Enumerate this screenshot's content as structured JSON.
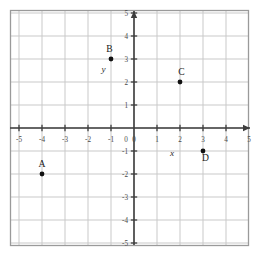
{
  "chart_data": {
    "type": "scatter",
    "title": "",
    "xlabel": "x",
    "ylabel": "y",
    "xlim": [
      -5,
      5
    ],
    "ylim": [
      -5,
      5
    ],
    "grid": true,
    "legend": "none",
    "x_ticks": [
      "-5",
      "-4",
      "-3",
      "-2",
      "-1",
      "0",
      "1",
      "2",
      "3",
      "4",
      "5"
    ],
    "y_ticks": [
      "5",
      "4",
      "3",
      "2",
      "1",
      "0",
      "-1",
      "-2",
      "-3",
      "-4",
      "-5"
    ],
    "x_tick_values": [
      -5,
      -4,
      -3,
      -2,
      -1,
      0,
      1,
      2,
      3,
      4,
      5
    ],
    "y_tick_values": [
      5,
      4,
      3,
      2,
      1,
      0,
      -1,
      -2,
      -3,
      -4,
      -5
    ],
    "points": [
      {
        "label": "A",
        "x": -4,
        "y": -2,
        "label_dx": 0,
        "label_dy": -7
      },
      {
        "label": "B",
        "x": -1,
        "y": 3,
        "label_dx": -1.5,
        "label_dy": -7
      },
      {
        "label": "C",
        "x": 2,
        "y": 2,
        "label_dx": 1.5,
        "label_dy": -7
      },
      {
        "label": "D",
        "x": 3,
        "y": -1,
        "label_dx": 2.5,
        "label_dy": 10
      }
    ],
    "axis_label_positions": {
      "x": {
        "x": 1.65,
        "y": -1.2
      },
      "y": {
        "x": -1.32,
        "y": 2.42
      }
    },
    "colors": {
      "background": "#ffffff",
      "grid": "#c9c9c9",
      "axis": "#3d3d3d",
      "border": "#9a9a9a",
      "point": "#111111",
      "tick_text": "#4a4a4a",
      "label_text": "#1a1a1a"
    }
  }
}
